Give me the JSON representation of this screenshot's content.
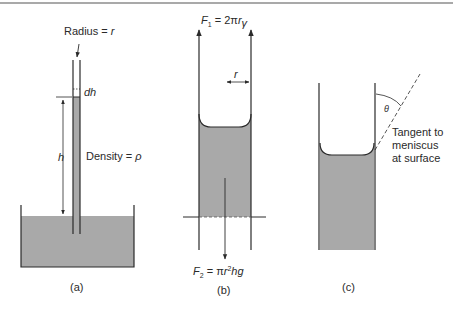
{
  "figure": {
    "colors": {
      "line": "#2a2a2a",
      "liquid": "#a9a9a9",
      "background": "#ffffff"
    },
    "panel_a": {
      "caption": "(a)",
      "radius_label": "Radius = ",
      "radius_var": "r",
      "dh_label": "dh",
      "h_label": "h",
      "density_label": "Density = ",
      "density_var": "ρ"
    },
    "panel_b": {
      "caption": "(b)",
      "f1_var": "F",
      "f1_sub": "1",
      "f1_rhs": " = 2π",
      "f1_r": "r",
      "f1_gamma": "γ",
      "r_label": "r",
      "f2_var": "F",
      "f2_sub": "2",
      "f2_rhs": " = π",
      "f2_r": "r",
      "f2_sup": "2",
      "f2_tail": "hg"
    },
    "panel_c": {
      "caption": "(c)",
      "theta_label": "θ",
      "tangent_line1": "Tangent to",
      "tangent_line2": "meniscus",
      "tangent_line3": "at surface"
    }
  }
}
